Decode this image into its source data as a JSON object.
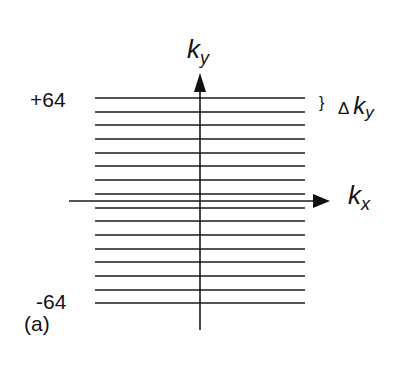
{
  "figure": {
    "panel_label": "(a)",
    "top_label": "+64",
    "bottom_label": "-64",
    "y_axis_label": "k",
    "y_axis_sub": "y",
    "x_axis_label": "k",
    "x_axis_sub": "x",
    "delta_symbol": "Δ",
    "delta_brace": "}",
    "delta_label": "k",
    "delta_sub": "y",
    "line_count": 16,
    "line_color": "#1a1a1a"
  }
}
